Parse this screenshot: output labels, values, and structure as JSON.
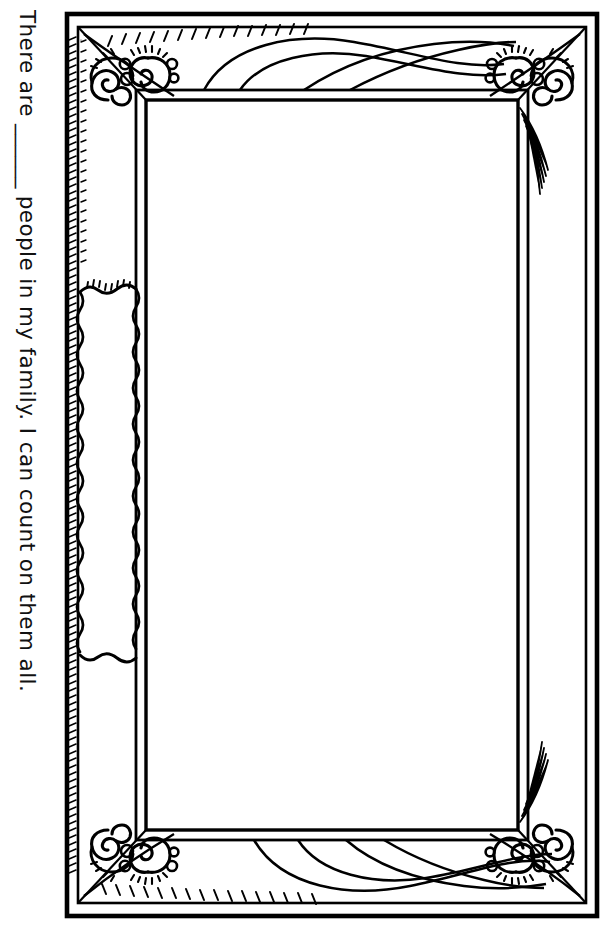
{
  "document": {
    "type": "coloring-page-worksheet",
    "orientation": "portrait",
    "background_color": "#ffffff",
    "ink_color": "#000000"
  },
  "caption": {
    "name": "family-count-prompt",
    "rotation_degrees": 90,
    "full_text": "There are ______ people in my family. I can count on them all.",
    "before_blank": "There are ",
    "blank": "______",
    "after_blank": " people in my family. I can count on them all.",
    "color": "#111111"
  },
  "frame": {
    "name": "ornate-picture-frame",
    "style": "line-art outline, uncolored",
    "stroke_color": "#000000",
    "fill_color": "#ffffff",
    "outer_label": "outer frame edge",
    "inner_label": "inner picture opening",
    "picture_area_label": "blank drawing area",
    "corners": [
      {
        "position": "top-left",
        "ornament": "double-spiral-scroll"
      },
      {
        "position": "top-right",
        "ornament": "double-spiral-scroll"
      },
      {
        "position": "bottom-left",
        "ornament": "double-spiral-scroll"
      },
      {
        "position": "bottom-right",
        "ornament": "double-spiral-scroll"
      }
    ],
    "decorations": [
      {
        "position": "top-rail",
        "ornament": "swoosh-wave-lines"
      },
      {
        "position": "bottom-rail",
        "ornament": "swoosh-wave-lines"
      },
      {
        "position": "left-rail",
        "ornament": "wavy-edged-cartouche"
      },
      {
        "position": "outer-edges",
        "ornament": "hatching-ticks"
      }
    ],
    "geometry": {
      "outer": {
        "x": 13,
        "y": 14,
        "width": 530,
        "height": 902
      },
      "mid": {
        "x": 25,
        "y": 28,
        "width": 506,
        "height": 874
      },
      "inner": {
        "x": 92,
        "y": 100,
        "width": 372,
        "height": 730
      },
      "cartouche": {
        "x": 26,
        "y": 280,
        "width": 56,
        "height": 380
      }
    }
  }
}
